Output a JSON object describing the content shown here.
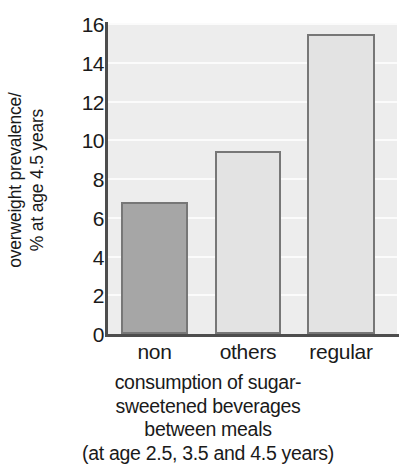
{
  "chart_data": {
    "type": "bar",
    "title": "",
    "categories": [
      "non",
      "others",
      "regular"
    ],
    "values": [
      6.8,
      9.45,
      15.5
    ],
    "series": [
      {
        "name": "overweight prevalence at age 4.5 years",
        "values": [
          6.8,
          9.45,
          15.5
        ]
      }
    ],
    "ylabel_lines": [
      "overweight prevalence/",
      "% at age 4.5 years"
    ],
    "ylabel": "overweight prevalence/ % at age 4.5 years",
    "xlabel_lines": [
      "consumption of sugar-",
      "sweetened beverages",
      "between meals",
      "(at age 2.5, 3.5 and 4.5 years)"
    ],
    "xlabel": "consumption of sugar-sweetened beverages between meals (at age 2.5, 3.5 and 4.5 years)",
    "ylim": [
      0,
      16
    ],
    "ytick_values": [
      0,
      2,
      4,
      6,
      8,
      10,
      12,
      14,
      16
    ],
    "ytick_labels": [
      "0",
      "2",
      "4",
      "6",
      "8",
      "10",
      "12",
      "14",
      "16"
    ],
    "grid": true,
    "grid_axis": "y",
    "legend": false,
    "legend_position": "none",
    "bar_colors": [
      "#a6a6a6",
      "#e3e3e3",
      "#e3e3e3"
    ],
    "bar_edge_color": "#777777",
    "plot_background": "#ededed",
    "gridline_color": "#fbfbfb",
    "axis_color": "#4d4d4d",
    "text_color": "#1a1a1a"
  }
}
